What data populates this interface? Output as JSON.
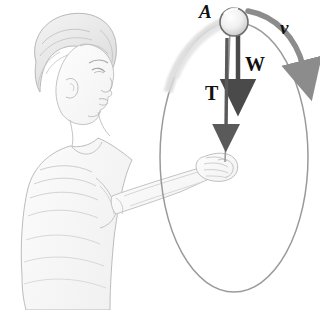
{
  "figure": {
    "kind": "physics-illustration",
    "background_color": "#ffffff",
    "ink_color": "#9a9a9a",
    "label_color": "#111111",
    "arrow_color_weight": "#4a4a4a",
    "arrow_color_velocity": "#8c8c8c",
    "path_color": "#8e8e8e"
  },
  "labels": {
    "point_a": "A",
    "velocity": "v",
    "weight": "W",
    "tension": "T"
  },
  "geometry": {
    "circle_center": {
      "x": 234,
      "y": 157
    },
    "circle_rx": 74,
    "circle_ry": 135,
    "ball_center": {
      "x": 234,
      "y": 22
    },
    "ball_radius": 14,
    "hand_grip": {
      "x": 222,
      "y": 163
    },
    "weight_arrow": {
      "x": 238,
      "y1": 36,
      "y2": 92
    },
    "tension_arrow": {
      "x": 227,
      "y1": 36,
      "y2": 136
    }
  }
}
